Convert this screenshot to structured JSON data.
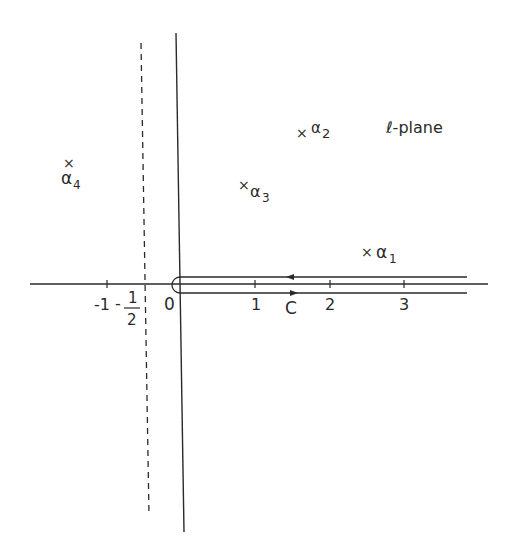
{
  "diagram": {
    "title": "ℓ-plane",
    "plane_label": "ℓ-plane",
    "axes": {
      "real_axis": {
        "ticks": [
          {
            "value": -1,
            "label": "-1"
          },
          {
            "value": 0,
            "label": "0"
          },
          {
            "value": 1,
            "label": "1"
          },
          {
            "value": 2,
            "label": "2"
          },
          {
            "value": 3,
            "label": "3"
          }
        ]
      },
      "imaginary_axis": true
    },
    "dashed_line": {
      "position": "Re ℓ = -1/2",
      "label_sign": "-",
      "label_num": "1",
      "label_den": "2"
    },
    "contour": {
      "label": "C",
      "description": "Hairpin contour around positive real axis, encircling origin; upper branch directed left, lower branch directed right"
    },
    "poles": [
      {
        "id": "alpha1",
        "marker": "×",
        "label": "α",
        "subscript": "1"
      },
      {
        "id": "alpha2",
        "marker": "×",
        "label": "α",
        "subscript": "2"
      },
      {
        "id": "alpha3",
        "marker": "×",
        "label": "α",
        "subscript": "3"
      },
      {
        "id": "alpha4",
        "marker": "×",
        "label": "α",
        "subscript": "4"
      }
    ],
    "colors": {
      "ink": "#2a2a2a",
      "background": "#ffffff"
    }
  }
}
